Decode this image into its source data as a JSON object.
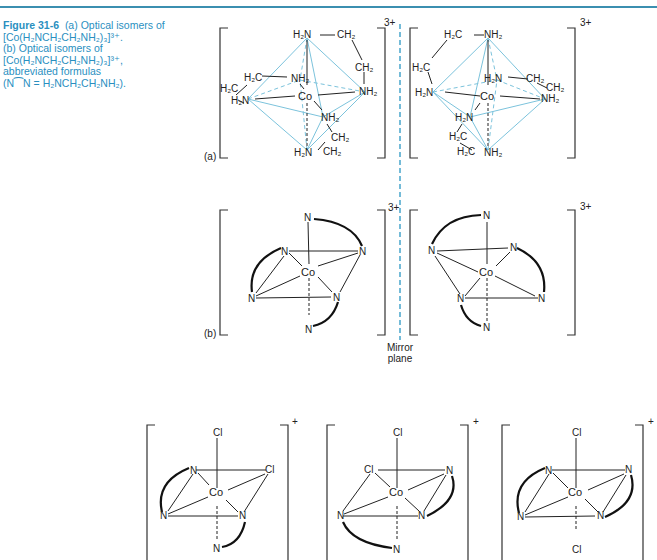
{
  "figure": {
    "number": "Figure 31-6",
    "caption_lines": [
      "(a) Optical isomers of",
      "[Co(H₂NCH₂CH₂NH₂)₃]³⁺.",
      "(b) Optical isomers of",
      "[Co(H₂NCH₂CH₂NH₂)₃]³⁺,",
      "abbreviated formulas",
      "(N⁀N = H₂NCH₂CH₂NH₂)."
    ],
    "accent_color": "#2a8fbf"
  },
  "panel_a": {
    "label": "(a)",
    "charge": "3+",
    "left_isomer": {
      "metal": "Co",
      "ligand_labels": [
        "H₂N",
        "CH₂",
        "CH₂",
        "NH₂",
        "H₂C",
        "H₂C",
        "H₂N",
        "NH₂",
        "NH₂",
        "CH₂",
        "H₂N",
        "CH₂"
      ]
    },
    "right_isomer": {
      "metal": "Co",
      "ligand_labels": [
        "H₂C",
        "NH₂",
        "H₂C",
        "H₂N",
        "H₂N",
        "CH₂",
        "CH₂",
        "NH₂",
        "H₂N",
        "H₂C",
        "H₂C",
        "NH₂"
      ]
    }
  },
  "panel_b": {
    "label": "(b)",
    "charge": "3+",
    "atom": "N",
    "metal": "Co"
  },
  "mirror": {
    "label_line1": "Mirror",
    "label_line2": "plane",
    "color": "#3a9fc8"
  },
  "panel_c": {
    "charge": "+",
    "metal": "Co",
    "cl": "Cl",
    "n": "N"
  }
}
